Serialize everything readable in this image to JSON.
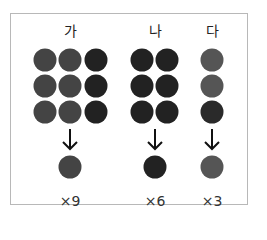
{
  "columns": [
    {
      "label": "가",
      "center_x": 70,
      "dots": [
        {
          "x": 45,
          "y": 60,
          "color": "#444444"
        },
        {
          "x": 70,
          "y": 60,
          "color": "#444444"
        },
        {
          "x": 96,
          "y": 60,
          "color": "#222222"
        },
        {
          "x": 45,
          "y": 86,
          "color": "#444444"
        },
        {
          "x": 70,
          "y": 86,
          "color": "#444444"
        },
        {
          "x": 96,
          "y": 86,
          "color": "#222222"
        },
        {
          "x": 45,
          "y": 112,
          "color": "#444444"
        },
        {
          "x": 70,
          "y": 112,
          "color": "#444444"
        },
        {
          "x": 96,
          "y": 112,
          "color": "#222222"
        }
      ],
      "result_dot_color": "#444444",
      "multiplier": "×9"
    },
    {
      "label": "나",
      "center_x": 155,
      "dots": [
        {
          "x": 142,
          "y": 60,
          "color": "#222222"
        },
        {
          "x": 167,
          "y": 60,
          "color": "#222222"
        },
        {
          "x": 142,
          "y": 86,
          "color": "#222222"
        },
        {
          "x": 167,
          "y": 86,
          "color": "#222222"
        },
        {
          "x": 142,
          "y": 112,
          "color": "#222222"
        },
        {
          "x": 167,
          "y": 112,
          "color": "#222222"
        }
      ],
      "result_dot_color": "#222222",
      "multiplier": "×6"
    },
    {
      "label": "다",
      "center_x": 212,
      "dots": [
        {
          "x": 212,
          "y": 60,
          "color": "#555555"
        },
        {
          "x": 212,
          "y": 86,
          "color": "#555555"
        },
        {
          "x": 212,
          "y": 112,
          "color": "#2a2a2a"
        }
      ],
      "result_dot_color": "#555555",
      "multiplier": "×3"
    }
  ]
}
